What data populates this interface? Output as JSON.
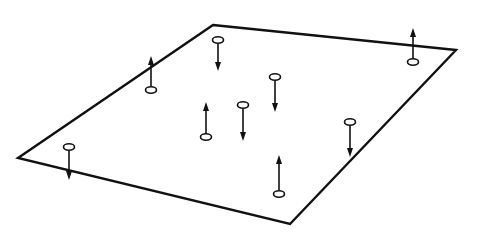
{
  "diagram": {
    "background": "#ffffff",
    "stroke_color": "#111111",
    "plate": {
      "vertices": [
        [
          213,
          25
        ],
        [
          456,
          50
        ],
        [
          290,
          224
        ],
        [
          18,
          158
        ]
      ]
    },
    "markers": [
      {
        "id": "m1",
        "x": 151,
        "ring_y": 90,
        "tip_y": 56,
        "direction": "up"
      },
      {
        "id": "m2",
        "x": 218,
        "ring_y": 40,
        "tip_y": 71,
        "direction": "down"
      },
      {
        "id": "m3",
        "x": 413,
        "ring_y": 62,
        "tip_y": 28,
        "direction": "up"
      },
      {
        "id": "m4",
        "x": 275,
        "ring_y": 77,
        "tip_y": 112,
        "direction": "down"
      },
      {
        "id": "m5",
        "x": 206,
        "ring_y": 137,
        "tip_y": 102,
        "direction": "up"
      },
      {
        "id": "m6",
        "x": 243,
        "ring_y": 105,
        "tip_y": 141,
        "direction": "down"
      },
      {
        "id": "m7",
        "x": 350,
        "ring_y": 122,
        "tip_y": 157,
        "direction": "down"
      },
      {
        "id": "m8",
        "x": 69,
        "ring_y": 147,
        "tip_y": 180,
        "direction": "down"
      },
      {
        "id": "m9",
        "x": 279,
        "ring_y": 194,
        "tip_y": 155,
        "direction": "up"
      }
    ]
  }
}
